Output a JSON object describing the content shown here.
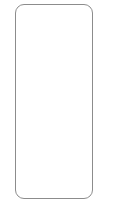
{
  "figure": {
    "kind": "blank-rounded-rectangle-outline",
    "background_color": "#ffffff",
    "canvas_width": 114,
    "canvas_height": 217
  },
  "frame": {
    "label": "",
    "stroke_color": "#8c8c8c",
    "fill_color": "#ffffff",
    "stroke_width": 1,
    "corner_radius": 9,
    "left": 15,
    "top": 4,
    "width": 78,
    "height": 195
  },
  "content": {
    "text": "",
    "note": ""
  }
}
